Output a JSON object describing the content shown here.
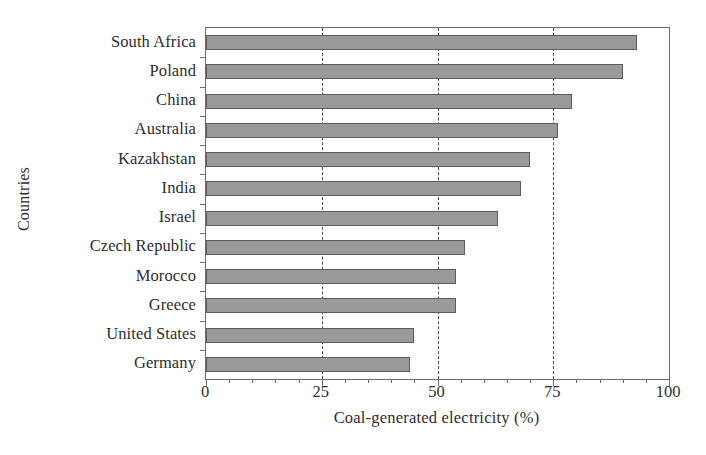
{
  "chart_data": {
    "type": "bar",
    "orientation": "horizontal",
    "title": "",
    "xlabel": "Coal-generated electricity (%)",
    "ylabel": "Countries",
    "categories": [
      "South Africa",
      "Poland",
      "China",
      "Australia",
      "Kazakhstan",
      "India",
      "Israel",
      "Czech Republic",
      "Morocco",
      "Greece",
      "United States",
      "Germany"
    ],
    "values": [
      93,
      90,
      79,
      76,
      70,
      68,
      63,
      56,
      54,
      54,
      45,
      44
    ],
    "xlim": [
      0,
      100
    ],
    "xticks": [
      0,
      25,
      50,
      75,
      100
    ],
    "xtick_labels": [
      "0",
      "25",
      "50",
      "75",
      "100"
    ],
    "xminor_step": 5,
    "grid": "vertical-dashed-at-major",
    "legend": null,
    "bar_fill_color": "#9a9a9a",
    "bar_edge_color": "#5d5d5d",
    "axis_color": "#6d6d6d",
    "background_color": "#ffffff"
  }
}
